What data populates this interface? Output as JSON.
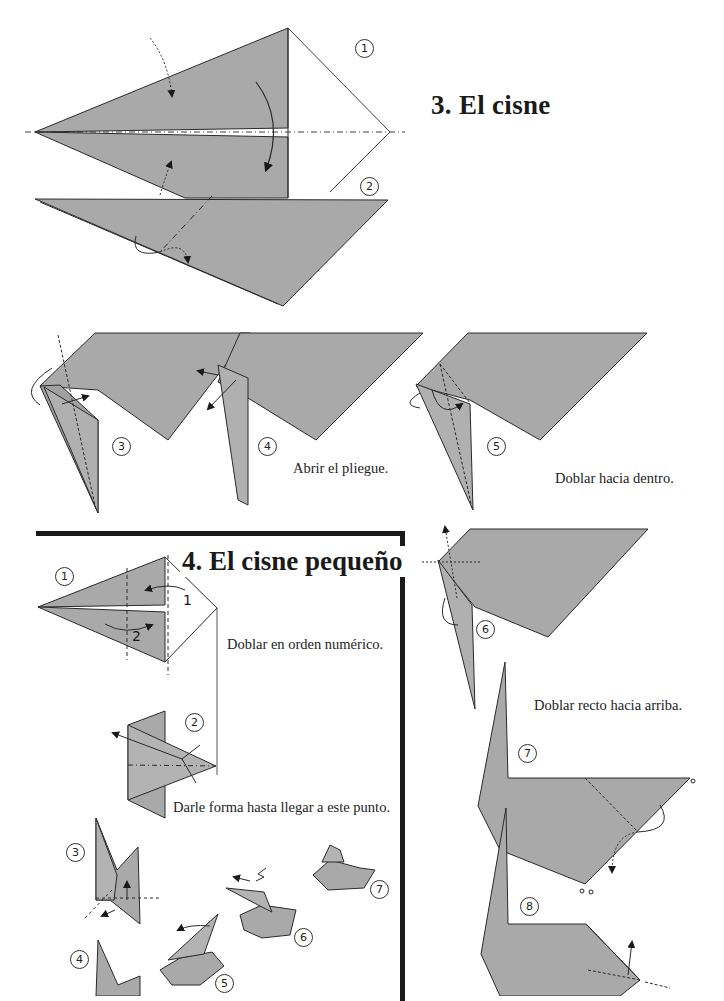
{
  "page": {
    "section3": {
      "title": "3.  El cisne",
      "captions": {
        "step4": "Abrir el pliegue.",
        "step5": "Doblar hacia dentro.",
        "step6": "Doblar recto hacia arriba."
      },
      "steps": [
        "1",
        "2",
        "3",
        "4",
        "5",
        "6",
        "7",
        "8"
      ]
    },
    "section4": {
      "title": "4. El cisne pequeño",
      "captions": {
        "step1": "Doblar en orden numérico.",
        "step2": "Darle forma hasta llegar a este punto."
      },
      "fold_order_labels": [
        "1",
        "2"
      ],
      "steps": [
        "1",
        "2",
        "3",
        "4",
        "5",
        "6",
        "7"
      ]
    },
    "colors": {
      "paper": "#a9a9a9",
      "paper_dark": "#9a9a9a",
      "line": "#2a2a2a",
      "frame": "#1a1a1a"
    }
  }
}
